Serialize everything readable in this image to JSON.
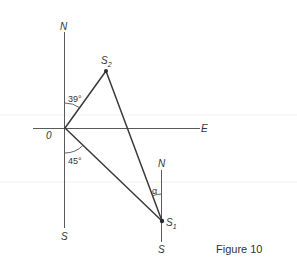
{
  "figure": {
    "caption": "Figure 10"
  },
  "compass_origin": {
    "north": "N",
    "south": "S",
    "east": "E",
    "origin": "0"
  },
  "compass_s1": {
    "north": "N",
    "south": "S"
  },
  "points": {
    "s2": {
      "letter": "S",
      "sub": "2"
    },
    "s1": {
      "letter": "S",
      "sub": "1"
    }
  },
  "angles": {
    "north_to_s2": "39°",
    "south_to_s1": "45°",
    "alpha": "α"
  },
  "colors": {
    "background": "#ffffff",
    "triangle_line": "#3a3a3a",
    "axis_line": "#5a5a5a",
    "text": "#333333"
  }
}
